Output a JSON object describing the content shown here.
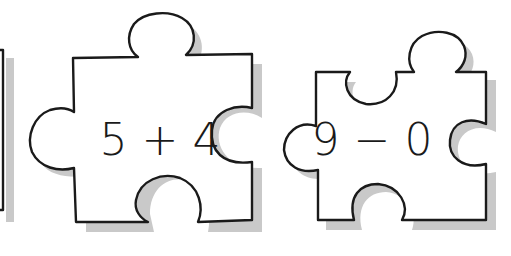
{
  "worksheet": {
    "pieces": [
      {
        "id": "partial-left",
        "expression": "",
        "visible": "partial"
      },
      {
        "id": "piece-1",
        "expression": "5 + 4",
        "operand_a": "5",
        "operator": "+",
        "operand_b": "4"
      },
      {
        "id": "piece-2",
        "expression": "9 − 0",
        "operand_a": "9",
        "operator": "−",
        "operand_b": "0"
      }
    ]
  },
  "colors": {
    "background": "#ffffff",
    "outline": "#1a1a1a",
    "shadow": "#c9c9c9"
  }
}
